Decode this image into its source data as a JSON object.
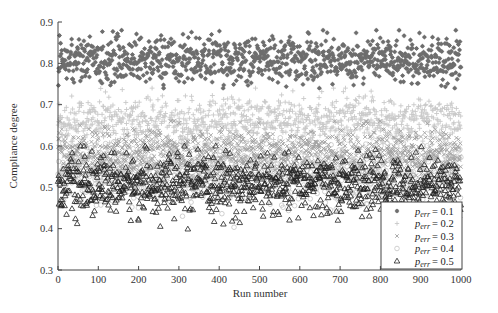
{
  "chart_data": {
    "type": "scatter",
    "title": "",
    "xlabel": "Run number",
    "ylabel": "Compliance degree",
    "xlim": [
      0,
      1000
    ],
    "ylim": [
      0.3,
      0.9
    ],
    "x_ticks": [
      0,
      100,
      200,
      300,
      400,
      500,
      600,
      700,
      800,
      900,
      1000
    ],
    "y_ticks": [
      0.3,
      0.4,
      0.5,
      0.6,
      0.7,
      0.8,
      0.9
    ],
    "grid": false,
    "legend_position": "lower right",
    "n_points_per_series": 1000,
    "series": [
      {
        "name": "p_err = 0.1",
        "label_sub": "err",
        "label_value": "= 0.1",
        "marker": "star",
        "color": "#6e6e6e",
        "mean": 0.81,
        "spread": 0.028,
        "min": 0.74,
        "max": 0.88
      },
      {
        "name": "p_err = 0.2",
        "label_sub": "err",
        "label_value": "= 0.2",
        "marker": "plus",
        "color": "#c8c8c8",
        "mean": 0.66,
        "spread": 0.03,
        "min": 0.56,
        "max": 0.74
      },
      {
        "name": "p_err = 0.3",
        "label_sub": "err",
        "label_value": "= 0.3",
        "marker": "x",
        "color": "#a0a0a0",
        "mean": 0.585,
        "spread": 0.028,
        "min": 0.5,
        "max": 0.66
      },
      {
        "name": "p_err = 0.4",
        "label_sub": "err",
        "label_value": "= 0.4",
        "marker": "circle",
        "color": "#c4c4c4",
        "mean": 0.535,
        "spread": 0.035,
        "min": 0.4,
        "max": 0.62
      },
      {
        "name": "p_err = 0.5",
        "label_sub": "err",
        "label_value": "= 0.5",
        "marker": "triangle",
        "color": "#222222",
        "mean": 0.505,
        "spread": 0.035,
        "min": 0.39,
        "max": 0.6
      }
    ],
    "legend_symbol": "p"
  }
}
